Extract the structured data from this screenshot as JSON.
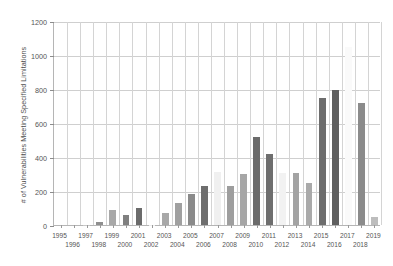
{
  "chart_data": {
    "type": "bar",
    "title": "",
    "xlabel": "",
    "ylabel": "# of Vulnerabilities Meeting Specified Limitations",
    "ylim": [
      0,
      1200
    ],
    "ytick_labels": [
      "0",
      "200",
      "400",
      "600",
      "800",
      "1000",
      "1200"
    ],
    "ytick_values": [
      0,
      200,
      400,
      600,
      800,
      1000,
      1200
    ],
    "grid": "both",
    "legend": "none",
    "categories": [
      "1995",
      "1996",
      "1997",
      "1998",
      "1999",
      "2000",
      "2001",
      "2002",
      "2003",
      "2004",
      "2005",
      "2006",
      "2007",
      "2008",
      "2009",
      "2010",
      "2011",
      "2012",
      "2013",
      "2014",
      "2015",
      "2016",
      "2017",
      "2018",
      "2019"
    ],
    "values": [
      0,
      0,
      3,
      15,
      90,
      60,
      100,
      2,
      72,
      128,
      182,
      228,
      310,
      228,
      303,
      520,
      418,
      305,
      305,
      250,
      748,
      792,
      1050,
      720,
      48
    ],
    "bar_colors": [
      "#f3f3f3",
      "#f3f3f3",
      "#c9c9c9",
      "#8f8f8f",
      "#a8a8a8",
      "#808080",
      "#6b6b6b",
      "#ededed",
      "#a8a8a8",
      "#a0a0a0",
      "#8a8a8a",
      "#6e6e6e",
      "#f0f0f0",
      "#9e9e9e",
      "#a6a6a6",
      "#6b6b6b",
      "#6e6e6e",
      "#f2f2f2",
      "#a3a3a3",
      "#aaaaaa",
      "#6d6d6d",
      "#5f5f5f",
      "#fafafa",
      "#8b8b8b",
      "#bdbdbd"
    ]
  },
  "axis_colors": {
    "grid": "#cfcfcf",
    "axis_line": "#b5b5b5",
    "tick_text": "#555555",
    "label_text": "#4d4d4d",
    "background": "#ffffff"
  }
}
